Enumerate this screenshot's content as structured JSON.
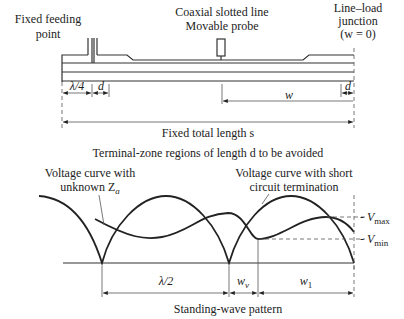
{
  "labels": {
    "feed_line1": "Fixed feeding",
    "feed_line2": "point",
    "probe_line1": "Coaxial slotted line",
    "probe_line2": "Movable probe",
    "junction_line1": "Line–load",
    "junction_line2": "junction",
    "junction_line3": "(w = 0)",
    "dim_quarter_wave": "λ/4",
    "dim_d_left": "d",
    "dim_d_right": "d",
    "dim_w": "w",
    "total_length": "Fixed total length s",
    "terminal_note": "Terminal-zone regions of length d to be avoided",
    "unknown_curve_line1": "Voltage curve with",
    "unknown_curve_line2": "unknown Z",
    "unknown_curve_sub": "a",
    "short_curve_line1": "Voltage curve with short",
    "short_curve_line2": "circuit termination",
    "vmax": "V",
    "vmax_sub": "max",
    "vmin": "V",
    "vmin_sub": "min",
    "dim_half_wave": "λ/2",
    "dim_wv": "w",
    "dim_wv_sub": "v",
    "dim_w1": "w",
    "dim_w1_sub": "1",
    "caption": "Standing-wave pattern"
  },
  "colors": {
    "ink": "#222222",
    "background": "#ffffff"
  }
}
